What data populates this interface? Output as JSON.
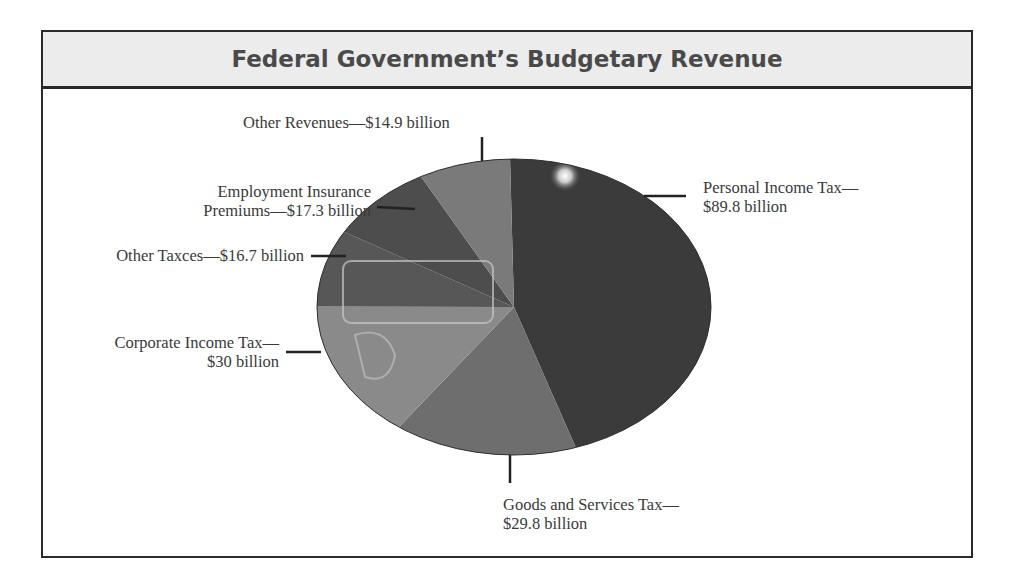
{
  "title": "Federal Government’s Budgetary Revenue",
  "labels": {
    "personal_line1": "Personal Income Tax—",
    "personal_line2": "$89.8 billion",
    "gst_line1": "Goods and Services Tax—",
    "gst_line2": "$29.8 billion",
    "corporate_line1": "Corporate Income Tax—",
    "corporate_line2": "$30 billion",
    "other_taxes": "Other Taxces—$16.7 billion",
    "ei_line1": "Employment Insurance",
    "ei_line2": "Premiums—$17.3 billion",
    "other_revenues": "Other Revenues—$14.9 billion"
  },
  "colors": {
    "personal": "#3b3b3b",
    "gst": "#6e6e6e",
    "corporate": "#8a8a8a",
    "other_taxes": "#575757",
    "ei": "#4d4d4d",
    "other_revenues": "#7a7a7a",
    "frame": "#2a2a2a",
    "title_bg": "#ececec"
  },
  "chart_data": {
    "type": "pie",
    "title": "Federal Government’s Budgetary Revenue",
    "unit": "billion dollars",
    "categories": [
      "Personal Income Tax",
      "Goods and Services Tax",
      "Corporate Income Tax",
      "Other Taxces",
      "Employment Insurance Premiums",
      "Other Revenues"
    ],
    "values": [
      89.8,
      29.8,
      30,
      16.7,
      17.3,
      14.9
    ],
    "value_labels": [
      "$89.8 billion",
      "$29.8 billion",
      "$30 billion",
      "$16.7 billion",
      "$17.3 billion",
      "$14.9 billion"
    ],
    "start_angle_deg": 0,
    "direction": "clockwise",
    "legend": "none (callout labels with leader lines)"
  }
}
